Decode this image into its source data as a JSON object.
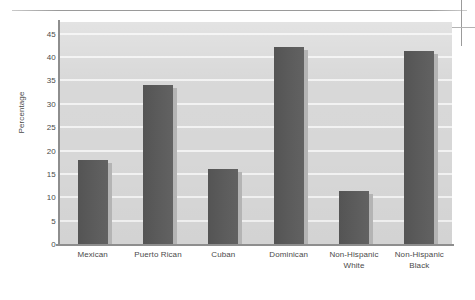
{
  "figure": {
    "y_axis_title": "Percentage",
    "artifacts": {
      "page_rule": "page-rule",
      "crop_mark_vertical": "crop-mark-vertical",
      "crop_mark_horizontal": "crop-mark-horizontal"
    }
  },
  "colors": {
    "bar": "#585858",
    "bar_shadow": "#b4b4b4",
    "plot_background": "#d7d7d7",
    "gridline": "#f2f2f2",
    "axis_line": "#8e8e8e",
    "text": "#4a4a4a",
    "page_background": "#ffffff"
  },
  "chart_data": {
    "type": "bar",
    "title": "",
    "xlabel": "",
    "ylabel": "Percentage",
    "categories": [
      "Mexican",
      "Puerto Rican",
      "Cuban",
      "Dominican",
      "Non-Hispanic White",
      "Non-Hispanic Black"
    ],
    "category_lines": [
      [
        "Mexican"
      ],
      [
        "Puerto Rican"
      ],
      [
        "Cuban"
      ],
      [
        "Dominican"
      ],
      [
        "Non-Hispanic",
        "White"
      ],
      [
        "Non-Hispanic",
        "Black"
      ]
    ],
    "values": [
      18.0,
      34.0,
      16.0,
      42.1,
      11.3,
      41.4
    ],
    "ylim": [
      0,
      47.5
    ],
    "yticks": [
      0,
      5,
      10,
      15,
      20,
      25,
      30,
      35,
      40,
      45
    ],
    "ytick_labels": [
      "0",
      "5",
      "10",
      "15",
      "20",
      "25",
      "30",
      "35",
      "40",
      "45"
    ],
    "grid": true,
    "grid_axis": "y",
    "legend": false,
    "legend_position": "none",
    "orientation": "vertical",
    "series": [
      {
        "name": "Percentage",
        "values": [
          18.0,
          34.0,
          16.0,
          42.1,
          11.3,
          41.4
        ]
      }
    ]
  }
}
